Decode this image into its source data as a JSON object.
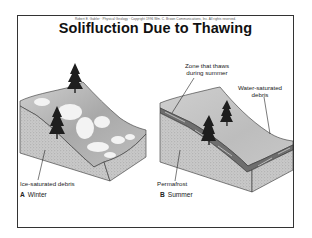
{
  "header": {
    "copyright": "Robert E. Gabler · Physical Geology · Copyright 1996 Wm. C. Brown Communications, Inc. All rights reserved.",
    "title": "Solifluction Due to Thawing"
  },
  "panels": [
    {
      "letter": "A",
      "season": "Winter",
      "labels": [
        "Ice-saturated debris"
      ]
    },
    {
      "letter": "B",
      "season": "Summer",
      "labels": [
        "Zone that thaws during summer",
        "Water-saturated debris",
        "Permafrost"
      ]
    }
  ],
  "labels": {
    "zone_line1": "Zone that thaws",
    "zone_line2": "during summer",
    "water_line1": "Water-saturated",
    "water_line2": "debris",
    "ice": "Ice-saturated debris",
    "permafrost": "Permafrost"
  },
  "colors": {
    "frame": "#333333",
    "ground_side": "#c8c8c8",
    "slope_surface": "#bdbdbd",
    "snow": "#f2f2f2",
    "tree": "#1e1e1e"
  }
}
